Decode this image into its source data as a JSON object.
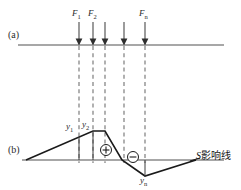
{
  "figure": {
    "panels": [
      {
        "tag": "(a)",
        "x": 8,
        "y": 30
      },
      {
        "tag": "(b)",
        "x": 8,
        "y": 145
      }
    ],
    "colors": {
      "beam": "#8a8a8a",
      "arrow": "#4a4a4a",
      "dashed": "#7d7d7d",
      "influence_line": "#1a1a1a",
      "baseline": "#8a8a8a",
      "text": "#2b2b2b"
    }
  },
  "panel_a": {
    "beam": {
      "x1": 18,
      "x2": 224,
      "y": 45
    },
    "forces": [
      {
        "label": "F",
        "sub": "1",
        "x": 79,
        "top": 22,
        "tip": 45,
        "show_label": true,
        "label_x": 72,
        "label_y": 9
      },
      {
        "label": "F",
        "sub": "2",
        "x": 93,
        "top": 22,
        "tip": 45,
        "show_label": true,
        "label_x": 88,
        "label_y": 9
      },
      {
        "label": "",
        "sub": "",
        "x": 105,
        "top": 22,
        "tip": 45,
        "show_label": false,
        "label_x": 0,
        "label_y": 0
      },
      {
        "label": "",
        "sub": "",
        "x": 124,
        "top": 22,
        "tip": 45,
        "show_label": false,
        "label_x": 0,
        "label_y": 0
      },
      {
        "label": "F",
        "sub": "n",
        "x": 145,
        "top": 22,
        "tip": 45,
        "show_label": true,
        "label_x": 139,
        "label_y": 9
      }
    ],
    "dashed_lines": [
      {
        "x": 79,
        "y1": 46,
        "y2": 163
      },
      {
        "x": 93,
        "y1": 46,
        "y2": 163
      },
      {
        "x": 105,
        "y1": 46,
        "y2": 163
      },
      {
        "x": 124,
        "y1": 46,
        "y2": 163
      },
      {
        "x": 145,
        "y1": 46,
        "y2": 163
      }
    ]
  },
  "panel_b": {
    "baseline": {
      "x1": 22,
      "x2": 224,
      "y": 160
    },
    "influence_polyline": [
      {
        "x": 26,
        "y": 160
      },
      {
        "x": 93,
        "y": 131
      },
      {
        "x": 105,
        "y": 131
      },
      {
        "x": 122,
        "y": 160
      },
      {
        "x": 145,
        "y": 176
      },
      {
        "x": 196,
        "y": 160
      }
    ],
    "ordinates": [
      {
        "label": "y",
        "sub": "1",
        "x": 79,
        "y_top": 137,
        "y_bot": 160,
        "label_x": 66,
        "label_y": 122
      },
      {
        "label": "y",
        "sub": "2",
        "x": 93,
        "y_top": 131,
        "y_bot": 160,
        "label_x": 82,
        "label_y": 120
      },
      {
        "label": "y",
        "sub": "n",
        "x": 145,
        "y_top": 160,
        "y_bot": 176,
        "label_x": 140,
        "label_y": 176
      }
    ],
    "sign_markers": [
      {
        "sign": "+",
        "cx": 106,
        "cy": 150,
        "r": 5.5
      },
      {
        "sign": "−",
        "cx": 133,
        "cy": 157,
        "r": 5.5
      }
    ],
    "caption": {
      "prefix": "S",
      "text": "影响线",
      "x": 196,
      "y": 151
    }
  }
}
